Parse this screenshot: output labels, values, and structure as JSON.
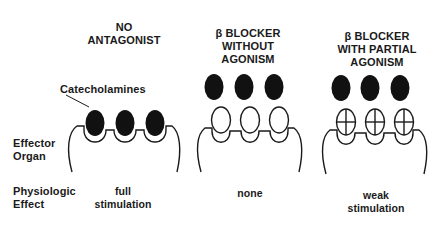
{
  "panels": [
    {
      "title_line1": "NO",
      "title_line2": "ANTAGONIST",
      "effect_line1": "full",
      "effect_line2": "stimulation",
      "ligand_bound": "catecholamine",
      "receptor_occupant": "none (agonist bound)"
    },
    {
      "title_line1": "β BLOCKER",
      "title_line2": "WITHOUT",
      "title_line3": "AGONISM",
      "effect_line1": "none",
      "receptor_occupant": "β blocker (empty ellipse)"
    },
    {
      "title_line1": "β BLOCKER",
      "title_line2": "WITH PARTIAL",
      "title_line3": "AGONISM",
      "effect_line1": "weak",
      "effect_line2": "stimulation",
      "receptor_occupant": "partial agonist β blocker (crossed ellipse)"
    }
  ],
  "row_labels": {
    "catecholamines": "Catecholamines",
    "effector_line1": "Effector",
    "effector_line2": "Organ",
    "effect_line1": "Physiologic",
    "effect_line2": "Effect"
  },
  "colors": {
    "ink": "#1a1a1a",
    "background": "#ffffff"
  }
}
